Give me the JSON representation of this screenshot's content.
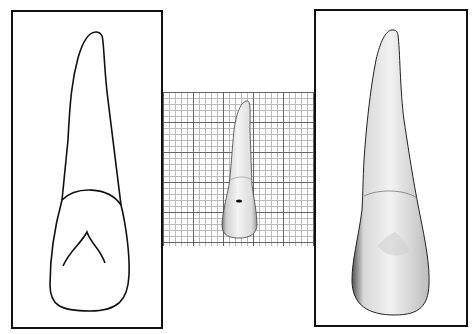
{
  "figure": {
    "panels": [
      {
        "id": "left",
        "kind": "line-drawing",
        "subject": "tooth outline (incisor, labial view)"
      },
      {
        "id": "center",
        "kind": "photo-on-grid",
        "subject": "tooth photographed on graph paper"
      },
      {
        "id": "right",
        "kind": "photo",
        "subject": "tooth photograph (enlarged)"
      }
    ],
    "colors": {
      "frame": "#111111",
      "grid_major": "#666666",
      "grid_minor": "#bbbbbb",
      "tooth": "#eeeeee"
    }
  }
}
